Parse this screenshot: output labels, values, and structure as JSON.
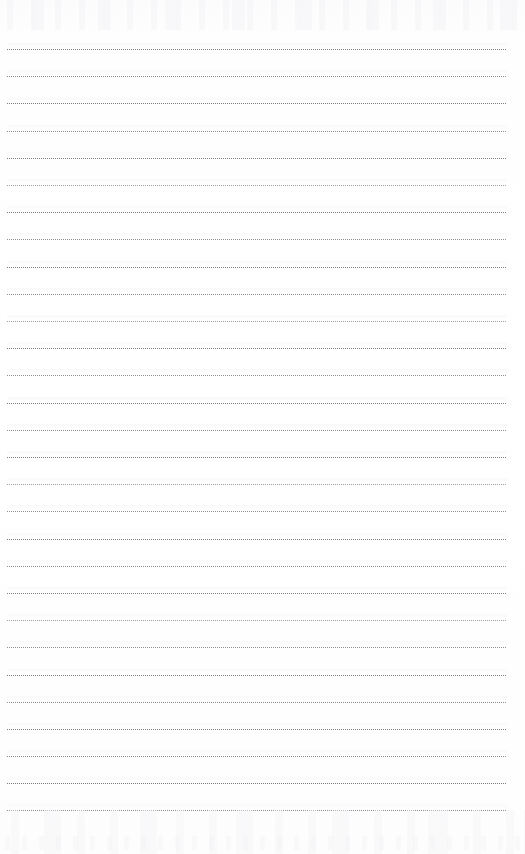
{
  "document": {
    "kind": "scanned-blank-lined-page",
    "title": "Blank Lined Notepad Page",
    "page_width": 525,
    "page_height": 854,
    "background_color": "#fefefe",
    "has_text_content": false,
    "visible_text": "",
    "body_text": "",
    "notes_written": "",
    "page_number": "",
    "header_text": "",
    "footer_text": ""
  },
  "ruling": {
    "style": "dotted",
    "line_color": "#7b7b80",
    "line_thickness_px": 1,
    "line_count": 29,
    "first_line_y": 49,
    "line_spacing_px": 27.2,
    "margin_left_px": 7,
    "margin_right_px": 18,
    "line_width_px": 500,
    "top_blank_margin_px": 49,
    "bottom_blank_margin_px": 44,
    "dot_period_px": 2,
    "ink_pattern": [
      "dark",
      "mid",
      "dark",
      "mid",
      "dark",
      "light",
      "dark",
      "mid",
      "dark",
      "mid",
      "light",
      "dark",
      "mid",
      "dark",
      "mid",
      "dark",
      "light",
      "mid",
      "dark",
      "mid",
      "dark",
      "light",
      "mid",
      "dark",
      "mid",
      "dark",
      "mid",
      "dark",
      "mid"
    ],
    "lines": [
      {
        "index": 1,
        "y": 49.0
      },
      {
        "index": 2,
        "y": 76.2
      },
      {
        "index": 3,
        "y": 103.4
      },
      {
        "index": 4,
        "y": 130.6
      },
      {
        "index": 5,
        "y": 157.8
      },
      {
        "index": 6,
        "y": 185.0
      },
      {
        "index": 7,
        "y": 212.2
      },
      {
        "index": 8,
        "y": 239.4
      },
      {
        "index": 9,
        "y": 266.6
      },
      {
        "index": 10,
        "y": 293.8
      },
      {
        "index": 11,
        "y": 321.0
      },
      {
        "index": 12,
        "y": 348.2
      },
      {
        "index": 13,
        "y": 375.4
      },
      {
        "index": 14,
        "y": 402.6
      },
      {
        "index": 15,
        "y": 429.8
      },
      {
        "index": 16,
        "y": 457.0
      },
      {
        "index": 17,
        "y": 484.2
      },
      {
        "index": 18,
        "y": 511.4
      },
      {
        "index": 19,
        "y": 538.6
      },
      {
        "index": 20,
        "y": 565.8
      },
      {
        "index": 21,
        "y": 593.0
      },
      {
        "index": 22,
        "y": 620.2
      },
      {
        "index": 23,
        "y": 647.4
      },
      {
        "index": 24,
        "y": 674.6
      },
      {
        "index": 25,
        "y": 701.8
      },
      {
        "index": 26,
        "y": 729.0
      },
      {
        "index": 27,
        "y": 756.2
      },
      {
        "index": 28,
        "y": 783.4
      },
      {
        "index": 29,
        "y": 810.0
      }
    ]
  },
  "scan_artifacts": {
    "top_ghosting": "faint bleed-through marks above first rule",
    "bottom_ghosting": "faint bleed-through marks below last rule",
    "description": "light scanner noise, no legible content"
  }
}
